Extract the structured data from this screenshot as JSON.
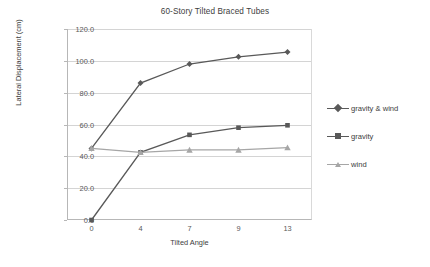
{
  "chart_data": {
    "type": "line",
    "title": "60-Story Tilted Braced Tubes",
    "xlabel": "Tilted Angle",
    "ylabel": "Lateral Displacement (cm)",
    "categories": [
      "0",
      "4",
      "7",
      "9",
      "13"
    ],
    "ylim": [
      0,
      120
    ],
    "yticks": [
      "0.0",
      "20.0",
      "40.0",
      "60.0",
      "80.0",
      "100.0",
      "120.0"
    ],
    "ytick_values": [
      0,
      20,
      40,
      60,
      80,
      100,
      120
    ],
    "grid": true,
    "legend_position": "right",
    "series": [
      {
        "name": "gravity & wind",
        "marker": "diamond",
        "color": "#595959",
        "values": [
          45.0,
          86.0,
          98.0,
          102.5,
          105.5
        ]
      },
      {
        "name": "gravity",
        "marker": "square",
        "color": "#595959",
        "values": [
          0.0,
          42.5,
          53.5,
          58.0,
          59.5
        ]
      },
      {
        "name": "wind",
        "marker": "triangle",
        "color": "#a6a6a6",
        "values": [
          45.0,
          42.5,
          44.0,
          44.0,
          45.5
        ]
      }
    ]
  },
  "colors": {
    "plot_background": "#ffffff",
    "gridline": "#d4d4d4",
    "axis": "#b7b7b7",
    "text": "#404040",
    "series_dark": "#595959",
    "series_light": "#a6a6a6"
  }
}
